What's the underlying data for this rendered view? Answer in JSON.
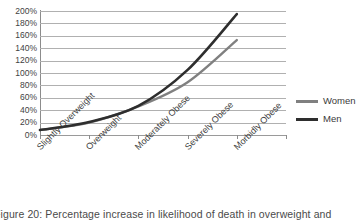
{
  "chart_data": {
    "type": "line",
    "title": "",
    "xlabel": "",
    "ylabel": "",
    "categories": [
      "Slightly Overweight",
      "Overweight",
      "Moderately Obese",
      "Severely Obese",
      "Morbidly Obese"
    ],
    "series": [
      {
        "name": "Women",
        "values": [
          8,
          20,
          46,
          85,
          153
        ],
        "color": "#808080"
      },
      {
        "name": "Men",
        "values": [
          8,
          21,
          47,
          105,
          195
        ],
        "color": "#2e2e2e"
      }
    ],
    "ylim": [
      0,
      200
    ],
    "ytick_values": [
      0,
      20,
      40,
      60,
      80,
      100,
      120,
      140,
      160,
      180,
      200
    ],
    "ytick_labels": [
      "0%",
      "20%",
      "40%",
      "60%",
      "80%",
      "100%",
      "120%",
      "140%",
      "160%",
      "180%",
      "200%"
    ],
    "grid": "horizontal",
    "legend_position": "right"
  },
  "legend": {
    "entries": [
      {
        "label": "Women",
        "color": "#808080"
      },
      {
        "label": "Men",
        "color": "#2e2e2e"
      }
    ]
  },
  "caption": {
    "text": "Figure 20: Percentage increase in likelihood of death in overweight and"
  }
}
